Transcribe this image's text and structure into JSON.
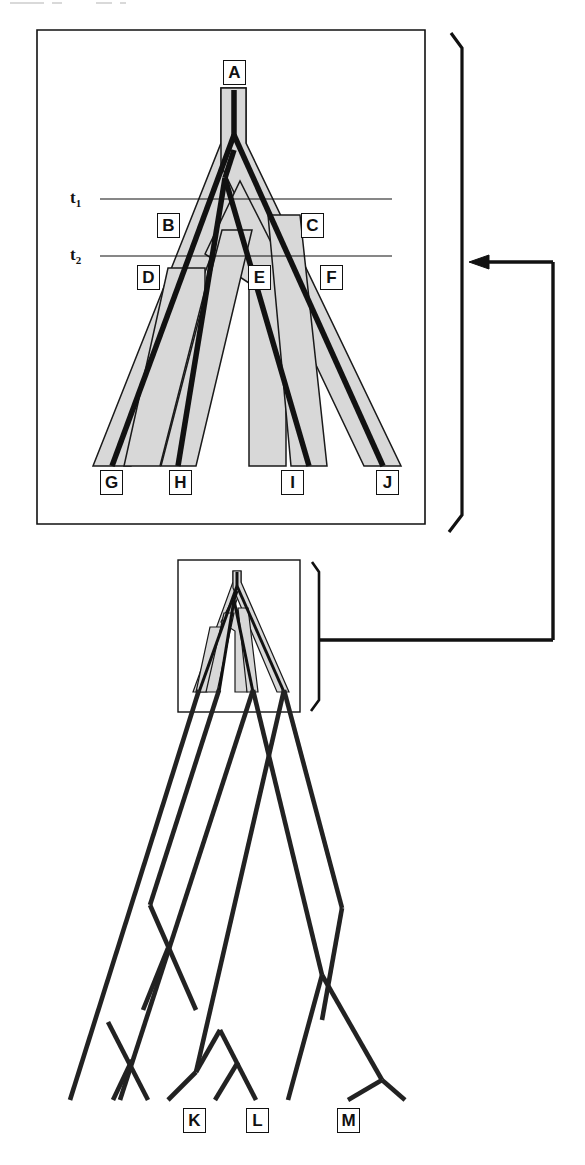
{
  "figure": {
    "type": "phylogeny-diagram",
    "background_color": "#ffffff",
    "ink_color": "#111111",
    "tube_fill_color": "#d8d8d8",
    "tube_stroke_color": "#1a1a1a"
  },
  "panel": {
    "name": "magnified-species-tree-panel",
    "border_color": "#111111",
    "time_lines": [
      {
        "id": "t1",
        "label": "t",
        "sub": "1"
      },
      {
        "id": "t2",
        "label": "t",
        "sub": "2"
      }
    ],
    "nodes": [
      {
        "id": "A",
        "label": "A",
        "role": "root-ancestral-population"
      },
      {
        "id": "B",
        "label": "B",
        "role": "internal-population-left"
      },
      {
        "id": "C",
        "label": "C",
        "role": "internal-population-right"
      },
      {
        "id": "D",
        "label": "D",
        "role": "internal-population"
      },
      {
        "id": "E",
        "label": "E",
        "role": "internal-population"
      },
      {
        "id": "F",
        "label": "F",
        "role": "internal-population"
      },
      {
        "id": "G",
        "label": "G",
        "role": "terminal-taxon"
      },
      {
        "id": "H",
        "label": "H",
        "role": "terminal-taxon"
      },
      {
        "id": "I",
        "label": "I",
        "role": "terminal-taxon"
      },
      {
        "id": "J",
        "label": "J",
        "role": "terminal-taxon"
      }
    ]
  },
  "inset": {
    "name": "inset-species-tree-box",
    "description": "small copy of the species tree embedded in the large gene tree"
  },
  "connector": {
    "name": "magnification-connector",
    "arrow_direction": "left",
    "description": "bracketed inset linked by an elbow line to an arrow entering the magnified panel"
  },
  "gene_tree": {
    "name": "large-gene-tree",
    "terminal_labels": [
      {
        "id": "K",
        "label": "K"
      },
      {
        "id": "L",
        "label": "L"
      },
      {
        "id": "M",
        "label": "M"
      }
    ]
  }
}
